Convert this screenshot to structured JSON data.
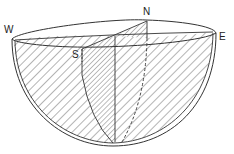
{
  "diagram": {
    "labels": {
      "north": "N",
      "south": "S",
      "east": "E",
      "west": "W"
    },
    "colors": {
      "line": "#333333",
      "background": "#ffffff"
    }
  }
}
